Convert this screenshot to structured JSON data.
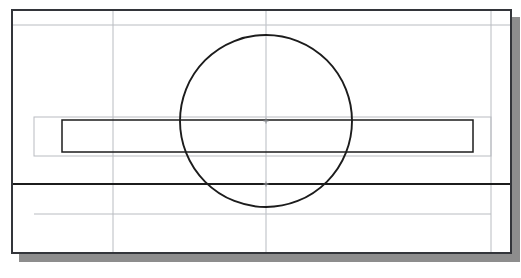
{
  "document": {
    "type": "cad-orthographic-drawing",
    "view_label": "front-view",
    "background_color": "#ffffff",
    "canvas_width": 521,
    "canvas_height": 278
  },
  "colors": {
    "object_line": "#1c1c1c",
    "construction_line": "#b9bcc1",
    "frame_border": "#33353a",
    "frame_fill": "#ffffff",
    "drop_shadow": "#8d8d8d",
    "center_mark": "#8a8d92"
  },
  "frame": {
    "name": "drawing-area-frame",
    "x": 11,
    "y": 9,
    "width": 501,
    "height": 245,
    "border_width": 2,
    "shadow_offset_x": 8,
    "shadow_offset_y": 8
  },
  "geometry": {
    "circle": {
      "name": "primary-circle",
      "center_x": 266,
      "center_y": 121,
      "radius": 86,
      "stroke_width": 1.9,
      "stroke": "#1c1c1c"
    },
    "object_rectangle": {
      "name": "object-rectangle",
      "x": 62,
      "y": 120,
      "width": 411,
      "height": 32,
      "stroke_width": 1.5,
      "stroke": "#1c1c1c"
    },
    "construction_rectangle": {
      "name": "construction-rectangle",
      "x": 34,
      "y": 117,
      "width": 457,
      "height": 39,
      "stroke_width": 1,
      "stroke": "#b9bcc1"
    },
    "object_horizontal_line": {
      "name": "object-horizontal-line",
      "x1": 13,
      "x2": 510,
      "y": 184,
      "stroke_width": 1.8,
      "stroke": "#1c1c1c"
    },
    "construction_horizontal_lines": [
      {
        "name": "construction-line-top",
        "x1": 13,
        "x2": 510,
        "y": 25
      },
      {
        "name": "construction-line-lower",
        "x1": 34,
        "x2": 491,
        "y": 214
      }
    ],
    "construction_vertical_lines": [
      {
        "name": "construction-line-left",
        "x": 113,
        "y1": 11,
        "y2": 252
      },
      {
        "name": "center-axis-vertical",
        "x": 266,
        "y1": 11,
        "y2": 252
      },
      {
        "name": "construction-line-right",
        "x": 491,
        "y1": 11,
        "y2": 252
      }
    ],
    "center_marks": [
      {
        "name": "center-mark-circle",
        "x": 266,
        "y": 121,
        "size": 5
      },
      {
        "name": "center-mark-lower",
        "x": 266,
        "y": 184,
        "size": 5
      }
    ]
  }
}
